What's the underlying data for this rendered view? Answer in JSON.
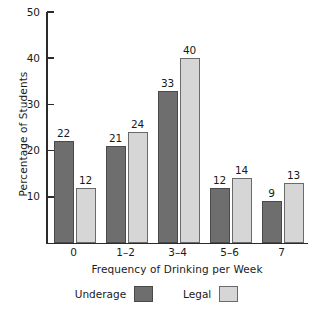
{
  "chart_data": {
    "type": "bar",
    "title": "",
    "xlabel": "Frequency of Drinking per Week",
    "ylabel": "Percentage of Students",
    "categories": [
      "0",
      "1–2",
      "3–4",
      "5–6",
      "7"
    ],
    "series": [
      {
        "name": "Underage",
        "color": "#6e6e6e",
        "values": [
          22,
          21,
          33,
          12,
          9
        ]
      },
      {
        "name": "Legal",
        "color": "#d6d6d6",
        "values": [
          12,
          24,
          40,
          14,
          13
        ]
      }
    ],
    "ylim": [
      0,
      50
    ],
    "yticks": [
      10,
      20,
      30,
      40,
      50
    ],
    "ytick_labels": [
      "10",
      "20",
      "30",
      "40",
      "50"
    ],
    "grid": false,
    "legend_position": "bottom",
    "data_labels": true
  },
  "legend": {
    "entries": [
      {
        "label": "Underage",
        "swatch": "underage-swatch"
      },
      {
        "label": "Legal",
        "swatch": "legal-swatch"
      }
    ]
  },
  "axes": {
    "y_title": "Percentage of Students",
    "x_title": "Frequency of Drinking per Week"
  }
}
